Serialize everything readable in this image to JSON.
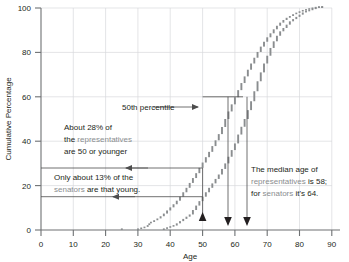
{
  "chart_data": {
    "type": "line",
    "title": "",
    "xlabel": "Age",
    "ylabel": "Cumulative Percentage",
    "xlim": [
      0,
      90
    ],
    "ylim": [
      0,
      100
    ],
    "xticks": [
      0,
      10,
      20,
      30,
      40,
      50,
      60,
      70,
      80,
      90
    ],
    "xtick_labels": [
      "0",
      "20",
      "40",
      "60",
      "80"
    ],
    "yticks": [
      0,
      20,
      40,
      60,
      80,
      100
    ],
    "ytick_labels": [
      "0",
      "20",
      "40",
      "60",
      "80",
      "100"
    ],
    "grid": true,
    "legend_position": "none",
    "series": [
      {
        "name": "representatives",
        "color": "#8a8d8f",
        "marker": "square",
        "points": [
          [
            25,
            0
          ],
          [
            30,
            0
          ],
          [
            31,
            0.4
          ],
          [
            32,
            0.8
          ],
          [
            33,
            1.4
          ],
          [
            33.5,
            2.2
          ],
          [
            34,
            3.0
          ],
          [
            35,
            3.6
          ],
          [
            36,
            4.4
          ],
          [
            37,
            5.2
          ],
          [
            38,
            6.2
          ],
          [
            39,
            7.4
          ],
          [
            40,
            8.8
          ],
          [
            41,
            10.2
          ],
          [
            42,
            11.6
          ],
          [
            43,
            13.2
          ],
          [
            44,
            15.0
          ],
          [
            45,
            17.0
          ],
          [
            46,
            19.0
          ],
          [
            47,
            21.2
          ],
          [
            48,
            23.4
          ],
          [
            49,
            25.6
          ],
          [
            50,
            28.0
          ],
          [
            51,
            30.4
          ],
          [
            52,
            32.8
          ],
          [
            53,
            35.2
          ],
          [
            54,
            37.8
          ],
          [
            55,
            40.4
          ],
          [
            56,
            43.2
          ],
          [
            57,
            46.4
          ],
          [
            58,
            50.0
          ],
          [
            59,
            53.4
          ],
          [
            60,
            56.6
          ],
          [
            61,
            59.8
          ],
          [
            62,
            63.0
          ],
          [
            63,
            66.2
          ],
          [
            64,
            69.2
          ],
          [
            65,
            72.2
          ],
          [
            66,
            75.0
          ],
          [
            67,
            77.6
          ],
          [
            68,
            80.2
          ],
          [
            69,
            82.6
          ],
          [
            70,
            84.8
          ],
          [
            71,
            86.8
          ],
          [
            72,
            88.6
          ],
          [
            73,
            90.4
          ],
          [
            74,
            92.0
          ],
          [
            75,
            93.4
          ],
          [
            76,
            94.6
          ],
          [
            77,
            95.6
          ],
          [
            78,
            96.4
          ],
          [
            79,
            97.2
          ],
          [
            80,
            97.8
          ],
          [
            81,
            98.4
          ],
          [
            82,
            98.8
          ],
          [
            83,
            99.2
          ],
          [
            84,
            99.5
          ],
          [
            85,
            99.8
          ],
          [
            86,
            100
          ],
          [
            87,
            100
          ]
        ]
      },
      {
        "name": "senators",
        "color": "#8a8d8f",
        "marker": "square",
        "points": [
          [
            38,
            0
          ],
          [
            39,
            0.5
          ],
          [
            40,
            1.0
          ],
          [
            41,
            1.5
          ],
          [
            42,
            2.0
          ],
          [
            43,
            3.0
          ],
          [
            44,
            4.0
          ],
          [
            45,
            5.0
          ],
          [
            46,
            6.0
          ],
          [
            47,
            7.0
          ],
          [
            48,
            9.0
          ],
          [
            49,
            11.0
          ],
          [
            50,
            13.0
          ],
          [
            51,
            15.0
          ],
          [
            52,
            17.0
          ],
          [
            53,
            19.0
          ],
          [
            54,
            21.0
          ],
          [
            55,
            23.0
          ],
          [
            56,
            25.0
          ],
          [
            57,
            27.5
          ],
          [
            58,
            30.0
          ],
          [
            59,
            33.0
          ],
          [
            60,
            36.0
          ],
          [
            61,
            39.0
          ],
          [
            62,
            43.0
          ],
          [
            63,
            46.5
          ],
          [
            64,
            50.0
          ],
          [
            65,
            54.0
          ],
          [
            66,
            58.0
          ],
          [
            67,
            62.5
          ],
          [
            68,
            67.0
          ],
          [
            69,
            71.0
          ],
          [
            70,
            75.0
          ],
          [
            71,
            78.5
          ],
          [
            72,
            82.0
          ],
          [
            73,
            85.0
          ],
          [
            74,
            87.5
          ],
          [
            75,
            89.5
          ],
          [
            76,
            91.0
          ],
          [
            77,
            92.5
          ],
          [
            78,
            94.0
          ],
          [
            79,
            95.0
          ],
          [
            80,
            96.0
          ],
          [
            81,
            97.0
          ],
          [
            82,
            98.0
          ],
          [
            83,
            98.5
          ],
          [
            84,
            99.0
          ],
          [
            85,
            99.5
          ],
          [
            86,
            100
          ],
          [
            87,
            100
          ]
        ]
      }
    ],
    "annotations": [
      {
        "id": "fiftieth-percentile",
        "text": "50th percentile",
        "x": 40,
        "y": 57
      },
      {
        "id": "representatives-28",
        "lines": [
          {
            "parts": [
              {
                "text": "About 28% of",
                "style": "dark"
              }
            ]
          },
          {
            "parts": [
              {
                "text": "the ",
                "style": "dark"
              },
              {
                "text": "representatives",
                "style": "gray"
              }
            ]
          },
          {
            "parts": [
              {
                "text": "are 50 or younger",
                "style": "dark"
              }
            ]
          }
        ]
      },
      {
        "id": "senators-13",
        "lines": [
          {
            "parts": [
              {
                "text": "Only about 13% of the",
                "style": "dark"
              }
            ]
          },
          {
            "parts": [
              {
                "text": "senators",
                "style": "gray"
              },
              {
                "text": " are that young.",
                "style": "dark"
              }
            ]
          }
        ]
      },
      {
        "id": "median-age",
        "lines": [
          {
            "parts": [
              {
                "text": "The median age of",
                "style": "dark"
              }
            ]
          },
          {
            "parts": [
              {
                "text": "representatives",
                "style": "gray"
              },
              {
                "text": " is 58;",
                "style": "dark"
              }
            ]
          },
          {
            "parts": [
              {
                "text": "for ",
                "style": "dark"
              },
              {
                "text": "senators",
                "style": "gray"
              },
              {
                "text": " it's 64.",
                "style": "dark"
              }
            ]
          }
        ]
      }
    ],
    "markers": {
      "up_arrow_age": 50,
      "down_arrow_ages": [
        58,
        64
      ],
      "guide_percentages": [
        13,
        28,
        50
      ],
      "median_representatives": 58,
      "median_senators": 64,
      "pct_representatives_at_50": 28,
      "pct_senators_at_50": 13
    },
    "colors": {
      "grid": "#d8dadc",
      "axis": "#6e7173",
      "data": "#8a8d8f",
      "text": "#231f20",
      "gray_text": "#8a8d8f",
      "annotation_line": "#4d4d4d"
    }
  },
  "labels": {
    "x_axis_title": "Age",
    "y_axis_title": "Cumulative Percentage",
    "fiftieth": "50th percentile",
    "rep28_l1": "About 28% of",
    "rep28_l2a": "the ",
    "rep28_l2b": "representatives",
    "rep28_l3": "are 50 or younger",
    "sen13_l1": "Only about 13% of the",
    "sen13_l2a": "senators",
    "sen13_l2b": " are that young.",
    "med_l1": "The median age of",
    "med_l2a": "representatives",
    "med_l2b": " is 58;",
    "med_l3a": "for ",
    "med_l3b": "senators",
    "med_l3c": " it's 64.",
    "y_100": "100",
    "y_80": "80",
    "y_60": "60",
    "y_40": "40",
    "y_20": "20",
    "y_0": "0",
    "x_0": "0",
    "x_20": "20",
    "x_40": "40",
    "x_60": "60",
    "x_80": "80",
    "x_90": "90",
    "x_30": "30",
    "x_50": "50",
    "x_70": "70",
    "x_10": "10"
  }
}
